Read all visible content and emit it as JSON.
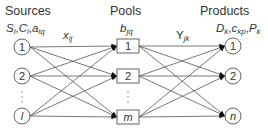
{
  "headers": {
    "sources": "Sources",
    "pools": "Pools",
    "products": "Products"
  },
  "labels": {
    "sources_params": {
      "parts": [
        [
          "S",
          "i"
        ],
        [
          "C",
          "i"
        ],
        [
          "a",
          "iq"
        ]
      ]
    },
    "pools_params": {
      "base": "b",
      "sub": "jq"
    },
    "flow_source_pool": {
      "base": "x",
      "sub": "ij"
    },
    "flow_pool_product": {
      "base": "Y",
      "sub": "jk"
    },
    "products_params": {
      "parts": [
        [
          "D",
          "k"
        ],
        [
          "c",
          "kp"
        ],
        [
          "P",
          "k"
        ]
      ]
    }
  },
  "sources": {
    "nodes": [
      "1",
      "2",
      "l"
    ],
    "ellipsis": "⋮"
  },
  "pools": {
    "nodes": [
      "1",
      "2",
      "m"
    ],
    "ellipsis": "⋮"
  },
  "products": {
    "nodes": [
      "1",
      "2",
      "n"
    ],
    "ellipsis": "⋮"
  },
  "colors": {
    "stroke": "#555555",
    "text": "#333333",
    "background": "#ffffff"
  }
}
